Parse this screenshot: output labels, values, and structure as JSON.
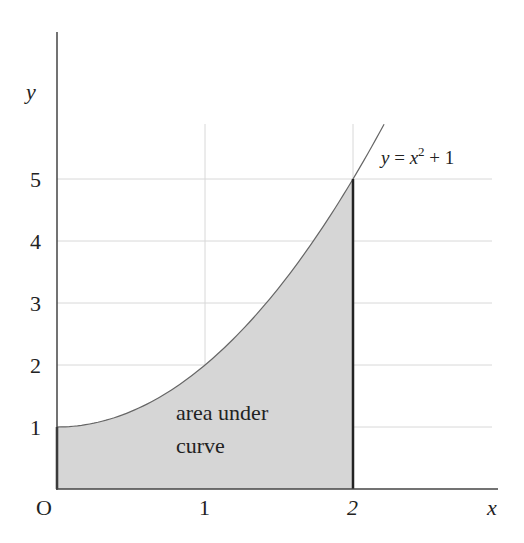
{
  "chart_data": {
    "type": "area",
    "title": "",
    "function": "y = x^2 + 1",
    "xlabel": "x",
    "ylabel": "y",
    "origin_label": "O",
    "x_ticks": [
      1,
      2
    ],
    "x_tick_labels": [
      "1",
      "2"
    ],
    "y_ticks": [
      1,
      2,
      3,
      4,
      5
    ],
    "y_tick_labels": [
      "1",
      "2",
      "3",
      "4",
      "5"
    ],
    "xlim": [
      0,
      2.95
    ],
    "ylim": [
      0,
      7.4
    ],
    "grid": true,
    "shaded_region": {
      "from": 0,
      "to": 2,
      "label_line1": "area under",
      "label_line2": "curve"
    },
    "curve_label": {
      "text_y": "y",
      "text_eq": " = ",
      "text_x": "x",
      "exp": "2",
      "text_rest": " + 1"
    },
    "curve_domain": [
      0,
      2.21
    ],
    "colors": {
      "axis": "#333333",
      "grid": "#d8d8d8",
      "fill": "#d6d6d6",
      "curve": "#666666",
      "boundary": "#222222"
    }
  }
}
